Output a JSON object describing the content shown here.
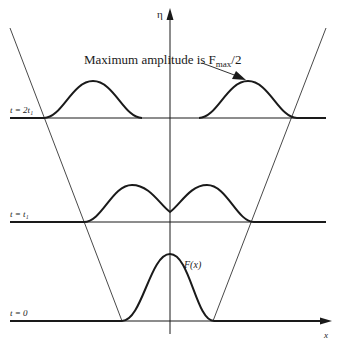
{
  "diagram": {
    "axes": {
      "vertical_label": "η",
      "horizontal_label": "x"
    },
    "annotation": {
      "text_prefix": "Maximum amplitude is F",
      "subscript": "max",
      "text_suffix": "/2"
    },
    "curve_label": "F(x)",
    "time_levels": [
      {
        "label": "t = 2t₁",
        "baseline_y": 118
      },
      {
        "label": "t = t₁",
        "baseline_y": 222
      },
      {
        "label": "t = 0",
        "baseline_y": 321
      }
    ],
    "colors": {
      "stroke": "#1a1a1a",
      "background": "#ffffff"
    }
  }
}
